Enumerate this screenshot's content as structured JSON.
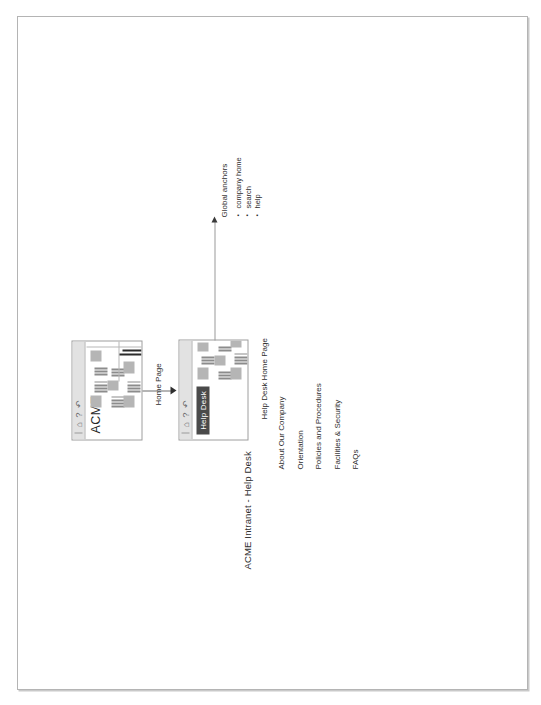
{
  "document": {
    "diagram_title": "ACME Intranet - Help Desk"
  },
  "pages": {
    "home": {
      "wordmark": "ACME",
      "caption": "Home Page",
      "toolbar_glyphs": "⌂ ? ↶"
    },
    "helpdesk": {
      "nav_tab": "Help Desk",
      "caption": "Help Desk Home Page",
      "toolbar_glyphs": "⌂ ? ↶"
    }
  },
  "menu": {
    "items": [
      {
        "label": "About Our Company"
      },
      {
        "label": "Orientation"
      },
      {
        "label": "Policies and Procedures"
      },
      {
        "label": "Facilities & Security"
      },
      {
        "label": "FAQs"
      }
    ]
  },
  "global_anchors": {
    "title": "Global anchors",
    "items": [
      {
        "label": "company home"
      },
      {
        "label": "search"
      },
      {
        "label": "help"
      }
    ]
  },
  "colors": {
    "nav_tab_background": "#4a4a4a",
    "toolbar_background": "#e2e2e2",
    "greek_bar": "#8c8c8c",
    "greek_box": "#b5b5b5",
    "page_border": "#b4b4b4",
    "connector": "#6d6d6d"
  }
}
